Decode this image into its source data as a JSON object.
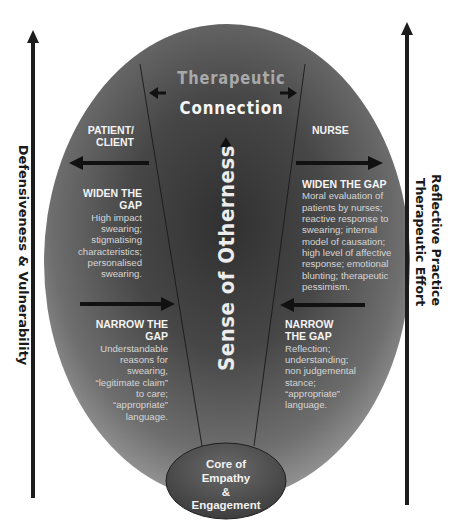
{
  "diagram": {
    "title_top": "Therapeutic",
    "title_bottom": "Connection",
    "center_axis_label": "Sense of Otherness",
    "left_axis_label": "Defensiveness & Vulnerability",
    "right_axis_labels": [
      "Therapeutic Effort",
      "Reflective Practice"
    ],
    "core": {
      "lines": [
        "Core of",
        "Empathy",
        "&",
        "Engagement"
      ]
    },
    "patient": {
      "heading_lines": [
        "PATIENT/",
        "CLIENT"
      ],
      "widen": {
        "heading_lines": [
          "WIDEN THE",
          "GAP"
        ],
        "body_lines": [
          "High impact",
          "swearing;",
          "stigmatising",
          "characteristics;",
          "personalised",
          "swearing."
        ]
      },
      "narrow": {
        "heading_lines": [
          "NARROW THE",
          "GAP"
        ],
        "body_lines": [
          "Understandable",
          "reasons for",
          "swearing,",
          "“legitimate claim”",
          "to care;",
          "“appropriate”",
          "language."
        ]
      }
    },
    "nurse": {
      "heading": "NURSE",
      "widen": {
        "heading": "WIDEN THE GAP",
        "body_lines": [
          "Moral evaluation of",
          "patients by nurses;",
          "reactive response to",
          "swearing; internal",
          "model of causation;",
          "high level of affective",
          "response; emotional",
          "blunting; therapeutic",
          "pessimism."
        ]
      },
      "narrow": {
        "heading_lines": [
          "NARROW",
          "THE GAP"
        ],
        "body_lines": [
          "Reflection;",
          "understanding;",
          "non judgemental",
          "stance;",
          "“appropriate”",
          "language."
        ]
      }
    },
    "colors": {
      "ellipse_center": "#3c3c3c",
      "ellipse_edge": "#8a8a8a",
      "arrow": "#1c1c1c",
      "title_grey": "#a9a9a9",
      "text_light": "#f0f0f0"
    }
  }
}
